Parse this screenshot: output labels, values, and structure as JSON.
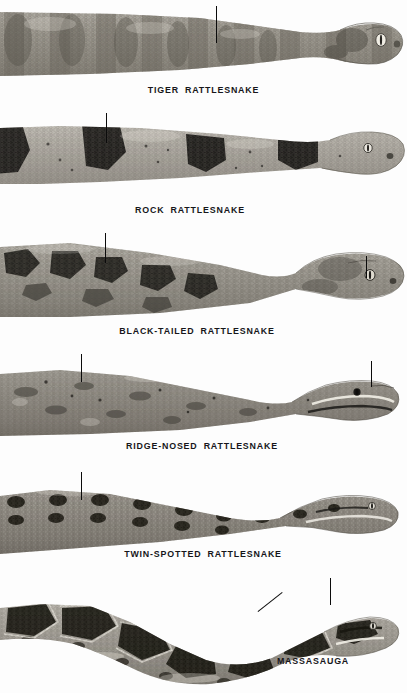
{
  "plate": {
    "title": "Rattlesnakes illustration plate",
    "background_color": "#fdfdfd",
    "ink_color": "#16161a",
    "width": 407,
    "height": 693
  },
  "figures": [
    {
      "id": "tiger-rattlesnake",
      "caption": "TIGER  RATTLESNAKE",
      "caption_x": 196,
      "caption_y": 88,
      "band_top": 0,
      "band_height": 104,
      "leaders": [
        {
          "type": "vertical",
          "x": 216,
          "y": 6,
          "length": 37
        }
      ]
    },
    {
      "id": "rock-rattlesnake",
      "caption": "ROCK  RATTLESNAKE",
      "caption_x": 190,
      "caption_y": 209,
      "band_top": 110,
      "band_height": 104,
      "leaders": [
        {
          "type": "vertical",
          "x": 106,
          "y": 113,
          "length": 30
        }
      ]
    },
    {
      "id": "black-tailed-rattlesnake",
      "caption": "BLACK-TAILED  RATTLESNAKE",
      "caption_x": 197,
      "caption_y": 330,
      "band_top": 231,
      "band_height": 104,
      "leaders": [
        {
          "type": "vertical",
          "x": 105,
          "y": 233,
          "length": 30
        },
        {
          "type": "vertical",
          "x": 366,
          "y": 256,
          "length": 22
        }
      ]
    },
    {
      "id": "ridge-nosed-rattlesnake",
      "caption": "RIDGE-NOSED  RATTLESNAKE",
      "caption_x": 202,
      "caption_y": 446,
      "band_top": 352,
      "band_height": 100,
      "leaders": [
        {
          "type": "vertical",
          "x": 81,
          "y": 354,
          "length": 28
        },
        {
          "type": "vertical",
          "x": 371,
          "y": 361,
          "length": 26
        }
      ]
    },
    {
      "id": "twin-spotted-rattlesnake",
      "caption": "TWIN-SPOTTED  RATTLESNAKE",
      "caption_x": 203,
      "caption_y": 556,
      "band_top": 468,
      "band_height": 100,
      "leaders": [
        {
          "type": "vertical",
          "x": 81,
          "y": 472,
          "length": 28
        }
      ]
    },
    {
      "id": "massasauga",
      "caption": "MASSASAUGA",
      "caption_x": 313,
      "caption_y": 661,
      "band_top": 578,
      "band_height": 115,
      "leaders": [
        {
          "type": "vertical",
          "x": 330,
          "y": 578,
          "length": 27
        },
        {
          "type": "diagonal",
          "x": 258,
          "y": 611,
          "x2": 282,
          "y2": 592
        }
      ]
    }
  ]
}
